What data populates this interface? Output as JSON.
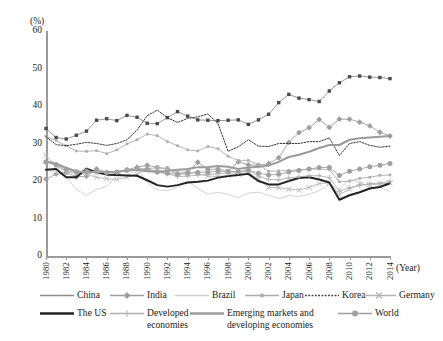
{
  "axes": {
    "y_unit_label": "(%)",
    "y_ticks": [
      "60",
      "50",
      "40",
      "30",
      "20",
      "10",
      "0"
    ],
    "x_caption": "(Year)",
    "x_ticks": [
      "1980",
      "1982",
      "1984",
      "1986",
      "1988",
      "1990",
      "1992",
      "1994",
      "1996",
      "1998",
      "2000",
      "2002",
      "2004",
      "2006",
      "2008",
      "2010",
      "2012",
      "2014"
    ]
  },
  "legend": {
    "row1": [
      {
        "label": "China",
        "marker": "none",
        "style": "solid",
        "color": "#8c8c8c"
      },
      {
        "label": "India",
        "marker": "diamond",
        "style": "solid",
        "color": "#9e9e9e"
      },
      {
        "label": "Brazil",
        "marker": "none",
        "style": "solid",
        "color": "#cfcfcf"
      },
      {
        "label": "Japan",
        "marker": "square-small",
        "style": "solid",
        "color": "#adadad"
      },
      {
        "label": "Korea",
        "marker": "none",
        "style": "dotted",
        "color": "#3a3a3a"
      },
      {
        "label": "Germany",
        "marker": "x",
        "style": "solid",
        "color": "#b4b4b4"
      }
    ],
    "row2": [
      {
        "label": "The US",
        "marker": "none",
        "style": "solid-thick",
        "color": "#232323"
      },
      {
        "label": "Developed\neconomies",
        "marker": "plus",
        "style": "solid",
        "color": "#b0b0b0"
      },
      {
        "label": "Emerging markets and\ndeveloping economies",
        "marker": "none",
        "style": "solid-thick",
        "color": "#9a9a9a"
      },
      {
        "label": "World",
        "marker": "circle",
        "style": "solid",
        "color": "#a0a0a0"
      }
    ]
  },
  "chart_data": {
    "type": "line",
    "title": "",
    "subtitle": "",
    "xlabel": "(Year)",
    "ylabel": "(%)",
    "ylim": [
      0,
      60
    ],
    "xlim": [
      1980,
      2014
    ],
    "grid": false,
    "legend_position": "bottom",
    "x": [
      1980,
      1981,
      1982,
      1983,
      1984,
      1985,
      1986,
      1987,
      1988,
      1989,
      1990,
      1991,
      1992,
      1993,
      1994,
      1995,
      1996,
      1997,
      1998,
      1999,
      2000,
      2001,
      2002,
      2003,
      2004,
      2005,
      2006,
      2007,
      2008,
      2009,
      2010,
      2011,
      2012,
      2013,
      2014
    ],
    "series": [
      {
        "name": "China",
        "color": "#8c8c8c",
        "style": "solid",
        "marker": "square",
        "values": [
          34.0,
          31.6,
          31.2,
          32.2,
          33.3,
          36.2,
          36.6,
          36.1,
          37.5,
          37.0,
          35.4,
          35.3,
          36.9,
          38.5,
          37.3,
          36.3,
          36.2,
          36.1,
          36.2,
          36.3,
          35.1,
          36.3,
          37.8,
          40.9,
          43.1,
          42.1,
          41.7,
          41.2,
          44.0,
          46.2,
          47.8,
          48.0,
          47.7,
          47.6,
          47.3
        ]
      },
      {
        "name": "India",
        "color": "#9e9e9e",
        "style": "solid",
        "marker": "diamond",
        "values": [
          20.5,
          21.9,
          22.3,
          21.1,
          21.3,
          23.2,
          22.3,
          22.0,
          23.0,
          23.7,
          24.2,
          23.6,
          23.3,
          21.8,
          22.3,
          25.0,
          23.1,
          23.2,
          22.5,
          25.1,
          24.3,
          24.2,
          24.6,
          26.2,
          30.3,
          32.9,
          34.2,
          36.4,
          34.3,
          36.5,
          36.5,
          35.7,
          34.7,
          33.0,
          32.0
        ]
      },
      {
        "name": "Brazil",
        "color": "#cfcfcf",
        "style": "solid",
        "marker": "none",
        "values": [
          23.0,
          22.2,
          21.0,
          17.8,
          16.2,
          17.8,
          18.6,
          21.4,
          21.5,
          23.5,
          19.5,
          17.6,
          17.4,
          18.4,
          20.0,
          18.0,
          16.5,
          17.0,
          16.5,
          15.5,
          16.8,
          17.0,
          16.2,
          15.3,
          16.1,
          15.9,
          16.4,
          17.4,
          19.1,
          17.8,
          20.5,
          19.7,
          18.2,
          18.3,
          17.2
        ]
      },
      {
        "name": "Japan",
        "color": "#adadad",
        "style": "solid",
        "marker": "square-small",
        "values": [
          31.9,
          30.8,
          29.4,
          28.0,
          27.9,
          28.1,
          27.3,
          28.3,
          29.9,
          31.0,
          32.5,
          32.1,
          30.5,
          29.4,
          28.3,
          28.0,
          29.2,
          28.6,
          26.6,
          25.5,
          25.5,
          24.4,
          22.6,
          22.7,
          22.8,
          23.0,
          23.2,
          23.2,
          23.0,
          19.8,
          19.9,
          20.7,
          21.0,
          21.5,
          21.6
        ]
      },
      {
        "name": "Korea",
        "color": "#3a3a3a",
        "style": "dotted",
        "marker": "none",
        "values": [
          31.8,
          29.7,
          29.4,
          29.8,
          30.3,
          30.0,
          29.5,
          30.0,
          31.0,
          33.6,
          37.4,
          38.9,
          36.9,
          35.6,
          36.7,
          37.1,
          37.9,
          35.3,
          27.9,
          29.1,
          31.0,
          29.3,
          29.2,
          30.0,
          30.0,
          30.0,
          30.5,
          30.5,
          31.5,
          26.8,
          30.0,
          30.5,
          29.5,
          29.0,
          29.3
        ]
      },
      {
        "name": "Germany",
        "color": "#b4b4b4",
        "style": "solid",
        "marker": "x",
        "values": [
          26.8,
          24.0,
          22.4,
          22.0,
          21.8,
          21.0,
          20.6,
          20.4,
          21.0,
          21.8,
          23.3,
          23.5,
          23.3,
          22.4,
          22.4,
          22.0,
          21.3,
          21.2,
          21.5,
          21.8,
          22.3,
          20.4,
          18.3,
          18.2,
          17.8,
          17.6,
          18.3,
          19.3,
          19.5,
          16.4,
          17.8,
          19.2,
          19.0,
          19.2,
          19.5
        ]
      },
      {
        "name": "The US",
        "color": "#232323",
        "style": "solid-thick",
        "marker": "none",
        "values": [
          23.0,
          23.2,
          21.0,
          21.0,
          23.3,
          22.3,
          21.7,
          21.6,
          21.5,
          21.4,
          20.2,
          18.9,
          18.5,
          18.9,
          19.6,
          19.8,
          20.1,
          20.9,
          21.3,
          21.6,
          21.9,
          20.0,
          19.1,
          19.1,
          20.0,
          20.8,
          21.0,
          20.4,
          19.6,
          15.0,
          16.2,
          17.0,
          18.0,
          18.4,
          19.4
        ]
      },
      {
        "name": "Developed economies",
        "color": "#b0b0b0",
        "style": "solid",
        "marker": "plus",
        "values": [
          25.0,
          24.2,
          22.8,
          22.3,
          22.7,
          22.4,
          22.2,
          22.3,
          22.8,
          23.2,
          23.3,
          22.4,
          21.9,
          21.2,
          21.3,
          21.6,
          21.7,
          22.0,
          22.1,
          22.3,
          22.8,
          21.3,
          20.4,
          20.3,
          20.8,
          21.1,
          21.4,
          21.4,
          20.9,
          17.3,
          18.2,
          18.8,
          19.3,
          19.4,
          19.9
        ]
      },
      {
        "name": "Emerging markets and developing economies",
        "color": "#9a9a9a",
        "style": "solid-thick",
        "marker": "none",
        "values": [
          25.3,
          24.6,
          23.5,
          22.6,
          22.2,
          22.5,
          22.4,
          22.5,
          22.8,
          23.0,
          22.6,
          22.5,
          22.7,
          23.0,
          23.2,
          23.7,
          23.7,
          24.0,
          23.8,
          23.2,
          23.6,
          23.8,
          24.1,
          25.1,
          26.4,
          27.0,
          27.8,
          28.8,
          29.6,
          29.6,
          31.0,
          31.4,
          31.6,
          31.8,
          32.0
        ]
      },
      {
        "name": "World",
        "color": "#a0a0a0",
        "style": "solid",
        "marker": "circle",
        "values": [
          25.1,
          24.4,
          23.2,
          22.5,
          22.6,
          22.5,
          22.3,
          22.4,
          22.9,
          23.2,
          23.1,
          22.4,
          22.1,
          21.8,
          22.0,
          22.3,
          22.4,
          22.6,
          22.6,
          22.5,
          22.9,
          22.1,
          21.6,
          21.8,
          22.4,
          22.8,
          23.2,
          23.6,
          23.6,
          21.5,
          22.6,
          23.2,
          23.8,
          24.2,
          24.7
        ]
      }
    ]
  }
}
